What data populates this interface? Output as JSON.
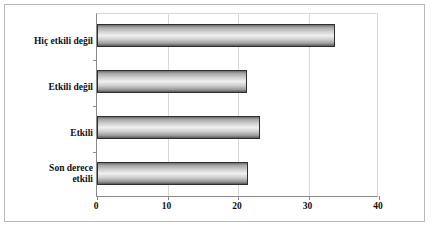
{
  "chart_data": {
    "type": "bar",
    "orientation": "horizontal",
    "title": "",
    "subtitle": "",
    "xlabel": "",
    "ylabel": "",
    "categories": [
      "Hiç etkili değil",
      "Etkili değil",
      "Etkili",
      "Son derece etkili"
    ],
    "category_lines": [
      [
        "Hiç etkili değil"
      ],
      [
        "Etkili değil"
      ],
      [
        "Etkili"
      ],
      [
        "Son derece",
        "etkili"
      ]
    ],
    "values": [
      33.8,
      21.3,
      23.1,
      21.4
    ],
    "xlim": [
      0,
      40
    ],
    "xticks": [
      0,
      10,
      20,
      30,
      40
    ],
    "xtick_labels": [
      "0",
      "10",
      "20",
      "30",
      "40"
    ],
    "grid": "vertical",
    "legend": "none",
    "series": [
      {
        "name": "",
        "values": [
          33.8,
          21.3,
          23.1,
          21.4
        ]
      }
    ],
    "colors": {
      "bar_outline": "#2f2f2f",
      "bar_fill_light": "#efefef",
      "bar_fill_dark": "#585858",
      "gridline": "#d8d8d8",
      "axis": "#8a8a8a",
      "frame": "#b9b9b9",
      "text": "#111111",
      "background": "#ffffff"
    }
  }
}
